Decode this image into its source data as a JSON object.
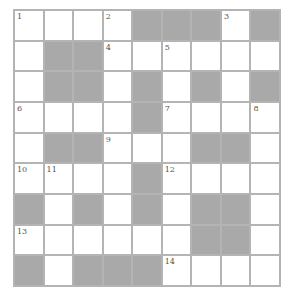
{
  "puzzle": {
    "rows": 9,
    "cols": 9,
    "colors": {
      "block": "#a9a9a9",
      "cell": "#ffffff",
      "line": "#b4b4b4",
      "number": "#555555"
    },
    "grid": [
      [
        "1",
        "",
        "",
        "2",
        "#",
        "#",
        "#",
        "3",
        "#"
      ],
      [
        "",
        "#",
        "#",
        "4",
        "",
        "5",
        "",
        "",
        ""
      ],
      [
        "",
        "#",
        "#",
        "",
        "#",
        "",
        "#",
        "",
        "#"
      ],
      [
        "6",
        "",
        "",
        "",
        "#",
        "7",
        "",
        "",
        "8"
      ],
      [
        "",
        "#",
        "#",
        "9",
        "",
        "",
        "#",
        "#",
        ""
      ],
      [
        "10",
        "11",
        "",
        "",
        "#",
        "12",
        "",
        "",
        ""
      ],
      [
        "#",
        "",
        "#",
        "",
        "#",
        "",
        "#",
        "#",
        ""
      ],
      [
        "13",
        "",
        "",
        "",
        "",
        "",
        "#",
        "#",
        ""
      ],
      [
        "#",
        "",
        "#",
        "#",
        "#",
        "14",
        "",
        "",
        ""
      ]
    ]
  }
}
